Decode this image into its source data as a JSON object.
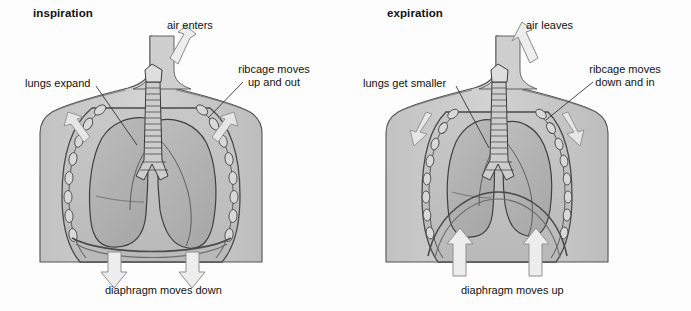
{
  "figure": {
    "type": "anatomical-diagram",
    "background_color": "#fdfdfd",
    "body_fill": "#c9c9c9",
    "lung_fill": "#b6b6b6",
    "outline_color": "#3a3a3a",
    "arrow_fill": "#e2e2e2",
    "arrow_stroke": "#8a8a8a"
  },
  "panels": [
    {
      "id": "inspiration",
      "title": "inspiration",
      "labels": {
        "air": "air enters",
        "lungs": "lungs expand",
        "ribcage_line1": "ribcage moves",
        "ribcage_line2": "up and out",
        "diaphragm": "diaphragm moves down"
      },
      "arrows": {
        "air_direction": "down-into-trachea",
        "shoulder_left_direction": "up-and-out",
        "shoulder_right_direction": "up-and-out",
        "diaphragm_direction": "down"
      },
      "diaphragm_state": "flattened",
      "chest_state": "expanded"
    },
    {
      "id": "expiration",
      "title": "expiration",
      "labels": {
        "air": "air leaves",
        "lungs": "lungs get smaller",
        "ribcage_line1": "ribcage moves",
        "ribcage_line2": "down and in",
        "diaphragm": "diaphragm moves up"
      },
      "arrows": {
        "air_direction": "up-out-of-trachea",
        "shoulder_left_direction": "down-and-in",
        "shoulder_right_direction": "down-and-in",
        "diaphragm_direction": "up"
      },
      "diaphragm_state": "domed",
      "chest_state": "contracted"
    }
  ]
}
